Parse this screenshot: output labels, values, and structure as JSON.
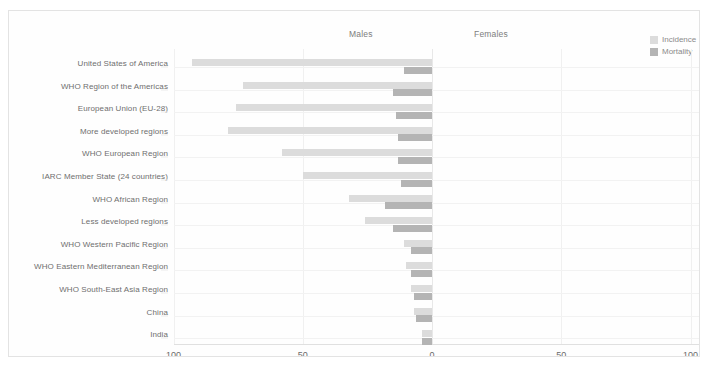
{
  "figure": {
    "group_headers": [
      {
        "name": "males",
        "label": "Males"
      },
      {
        "name": "females",
        "label": "Females"
      }
    ],
    "legend": [
      {
        "name": "incidence",
        "label": "Incidence",
        "color": "#dcdcdc"
      },
      {
        "name": "mortality",
        "label": "Mortality",
        "color": "#b4b4b4"
      }
    ]
  },
  "chart_data": {
    "type": "bar",
    "orientation": "horizontal",
    "layout": "mirrored-population-pyramid",
    "title": "",
    "subtitle": "",
    "xlabel": "",
    "ylabel": "",
    "grid": true,
    "legend_position": "top-right",
    "panels": [
      {
        "name": "males",
        "label": "Males",
        "direction": "left",
        "xlim": [
          0,
          100
        ]
      },
      {
        "name": "females",
        "label": "Females",
        "direction": "right",
        "xlim": [
          0,
          100
        ]
      }
    ],
    "axis_ticks_left": [
      "100",
      "50",
      "0"
    ],
    "axis_ticks_right": [
      "0",
      "50",
      "100"
    ],
    "tick_values": [
      100,
      50,
      0,
      50,
      100
    ],
    "categories": [
      "United States of America",
      "WHO Region of the Americas",
      "European Union (EU-28)",
      "More developed regions",
      "WHO European Region",
      "IARC Member State (24 countries)",
      "WHO African Region",
      "Less developed regions",
      "WHO Western Pacific Region",
      "WHO Eastern Mediterranean Region",
      "WHO South-East Asia Region",
      "China",
      "India"
    ],
    "series": [
      {
        "name": "Incidence",
        "panel": "males",
        "color": "#dcdcdc",
        "values": [
          93,
          73,
          76,
          79,
          58,
          50,
          32,
          26,
          11,
          10,
          8,
          7,
          4
        ]
      },
      {
        "name": "Mortality",
        "panel": "males",
        "color": "#b4b4b4",
        "values": [
          11,
          15,
          14,
          13,
          13,
          12,
          18,
          15,
          8,
          8,
          7,
          6,
          4
        ]
      }
    ]
  }
}
